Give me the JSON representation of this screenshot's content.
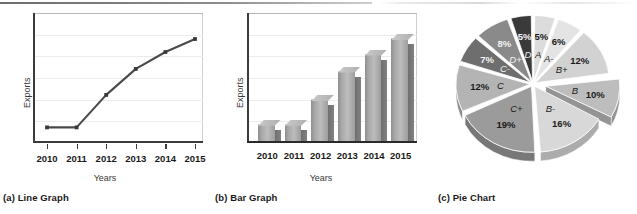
{
  "figure": {
    "panels": [
      {
        "key": "line",
        "caption": "(a)  Line Graph"
      },
      {
        "key": "bar",
        "caption": "(b)  Bar Graph"
      },
      {
        "key": "pie",
        "caption": "(c)  Pie Chart"
      }
    ]
  },
  "chart_data": [
    {
      "type": "line",
      "title": "",
      "xlabel": "Years",
      "ylabel": "Exports",
      "categories": [
        "2010",
        "2011",
        "2012",
        "2013",
        "2014",
        "2015"
      ],
      "values": [
        12,
        12,
        37,
        57,
        70,
        80
      ],
      "ylim": [
        0,
        100
      ],
      "grid": true,
      "legend": "none",
      "series_color": "#4a4a4a",
      "marker": "square"
    },
    {
      "type": "bar",
      "title": "",
      "xlabel": "Years",
      "ylabel": "Exports",
      "categories": [
        "2010",
        "2011",
        "2012",
        "2013",
        "2014",
        "2015"
      ],
      "values": [
        14,
        14,
        33,
        55,
        68,
        80
      ],
      "ylim": [
        0,
        100
      ],
      "grid": true,
      "legend": "none",
      "bar_color": "#a8a8a8",
      "bar_side_color": "#767676"
    },
    {
      "type": "pie",
      "title": "",
      "legend": "none",
      "exploded_slice": "B",
      "labels": [
        "A",
        "A-",
        "B+",
        "B",
        "B-",
        "C+",
        "C",
        "C-",
        "D+",
        "D"
      ],
      "values": [
        5,
        6,
        12,
        10,
        16,
        19,
        12,
        7,
        8,
        5
      ],
      "percent_labels": [
        "5%",
        "6%",
        "12%",
        "10%",
        "16%",
        "19%",
        "12%",
        "7%",
        "8%",
        "5%"
      ],
      "slice_colors": [
        "#dcdcdc",
        "#e4e4e4",
        "#d2d2d2",
        "#bdbdbd",
        "#d8d8d8",
        "#9b9b9b",
        "#b4b4b4",
        "#6e6e6e",
        "#8a8a8a",
        "#3a3a3a"
      ],
      "slice_edge_colors": [
        "#b0b0b0",
        "#b8b8b8",
        "#a6a6a6",
        "#949494",
        "#acacac",
        "#787878",
        "#8c8c8c",
        "#4e4e4e",
        "#666666",
        "#222222"
      ]
    }
  ]
}
